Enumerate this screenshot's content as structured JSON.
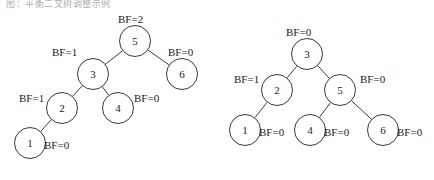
{
  "figure": {
    "top_partial_text": "图：平衡二叉树调整示例",
    "width": 434,
    "height": 180,
    "node_radius": 16,
    "stroke_color": "#3a3a3a",
    "text_color": "#1c1c1c",
    "background": "#ffffff"
  },
  "trees": [
    {
      "id": "left-tree",
      "name": "avl-tree-before",
      "nodes": [
        {
          "id": "L5",
          "label": "5",
          "bf_label": "BF=2",
          "x": 135,
          "y": 41,
          "bf_x": 118,
          "bf_y": 13,
          "bf_align": "center"
        },
        {
          "id": "L3",
          "label": "3",
          "bf_label": "BF=1",
          "x": 93,
          "y": 74,
          "bf_x": 52,
          "bf_y": 46,
          "bf_align": "left"
        },
        {
          "id": "L6",
          "label": "6",
          "bf_label": "BF=0",
          "x": 182,
          "y": 74,
          "bf_x": 168,
          "bf_y": 46,
          "bf_align": "left"
        },
        {
          "id": "L2",
          "label": "2",
          "bf_label": "BF=1",
          "x": 62,
          "y": 108,
          "bf_x": 19,
          "bf_y": 92,
          "bf_align": "left"
        },
        {
          "id": "L4",
          "label": "4",
          "bf_label": "BF=0",
          "x": 118,
          "y": 108,
          "bf_x": 134,
          "bf_y": 92,
          "bf_align": "left"
        },
        {
          "id": "L1",
          "label": "1",
          "bf_label": "BF=0",
          "x": 30,
          "y": 143,
          "bf_x": 44,
          "bf_y": 139,
          "bf_align": "left"
        }
      ],
      "edges": [
        {
          "from": "L5",
          "to": "L3"
        },
        {
          "from": "L5",
          "to": "L6"
        },
        {
          "from": "L3",
          "to": "L2"
        },
        {
          "from": "L3",
          "to": "L4"
        },
        {
          "from": "L2",
          "to": "L1"
        }
      ]
    },
    {
      "id": "right-tree",
      "name": "avl-tree-after",
      "nodes": [
        {
          "id": "R3",
          "label": "3",
          "bf_label": "BF=0",
          "x": 307,
          "y": 54,
          "bf_x": 286,
          "bf_y": 26,
          "bf_align": "center"
        },
        {
          "id": "R2",
          "label": "2",
          "bf_label": "BF=1",
          "x": 277,
          "y": 90,
          "bf_x": 234,
          "bf_y": 73,
          "bf_align": "left"
        },
        {
          "id": "R5",
          "label": "5",
          "bf_label": "BF=0",
          "x": 340,
          "y": 90,
          "bf_x": 360,
          "bf_y": 73,
          "bf_align": "left"
        },
        {
          "id": "R1",
          "label": "1",
          "bf_label": "BF=0",
          "x": 245,
          "y": 130,
          "bf_x": 259,
          "bf_y": 126,
          "bf_align": "left"
        },
        {
          "id": "R4",
          "label": "4",
          "bf_label": "BF=0",
          "x": 310,
          "y": 130,
          "bf_x": 324,
          "bf_y": 126,
          "bf_align": "left"
        },
        {
          "id": "R6",
          "label": "6",
          "bf_label": "BF=0",
          "x": 383,
          "y": 130,
          "bf_x": 397,
          "bf_y": 126,
          "bf_align": "left"
        }
      ],
      "edges": [
        {
          "from": "R3",
          "to": "R2"
        },
        {
          "from": "R3",
          "to": "R5"
        },
        {
          "from": "R2",
          "to": "R1"
        },
        {
          "from": "R5",
          "to": "R4"
        },
        {
          "from": "R5",
          "to": "R6"
        }
      ]
    }
  ]
}
